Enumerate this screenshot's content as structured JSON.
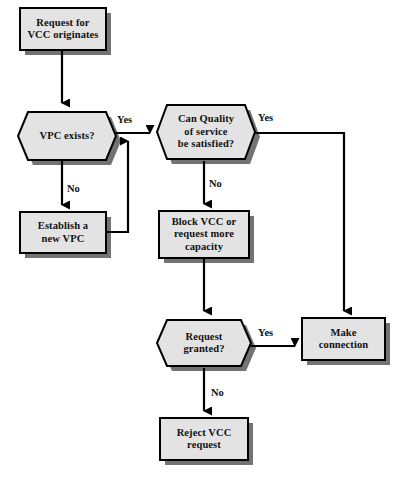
{
  "diagram": {
    "type": "flowchart",
    "colors": {
      "node_fill": "#e3e3e3",
      "node_border": "#000000",
      "node_shadow": "#737373",
      "line": "#000000",
      "text": "#111111",
      "background": "#ffffff"
    },
    "nodes": [
      {
        "id": "request-for-vcc-originates",
        "shape": "process",
        "label": "Request for\nVCC originates",
        "x": 20,
        "y": 8,
        "w": 86,
        "h": 42
      },
      {
        "id": "vpc-exists",
        "shape": "decision",
        "label": "VPC exists?",
        "x": 16,
        "y": 110,
        "w": 96,
        "h": 48
      },
      {
        "id": "establish-a-new-vpc",
        "shape": "process",
        "label": "Establish a\nnew VPC",
        "x": 20,
        "y": 212,
        "w": 86,
        "h": 41
      },
      {
        "id": "can-quality-of-service-be-satisfied",
        "shape": "decision",
        "label": "Can Quality\nof service\nbe satisfied?",
        "x": 157,
        "y": 103,
        "w": 98,
        "h": 58
      },
      {
        "id": "block-vcc-or-request-more-capacity",
        "shape": "process",
        "label": "Block VCC or\nrequest more\ncapacity",
        "x": 159,
        "y": 211,
        "w": 90,
        "h": 47
      },
      {
        "id": "request-granted",
        "shape": "decision",
        "label": "Request\ngranted?",
        "x": 155,
        "y": 318,
        "w": 96,
        "h": 50
      },
      {
        "id": "reject-vcc-request",
        "shape": "process",
        "label": "Reject VCC\nrequest",
        "x": 160,
        "y": 418,
        "w": 88,
        "h": 42
      },
      {
        "id": "make-connection",
        "shape": "process",
        "label": "Make\nconnection",
        "x": 302,
        "y": 318,
        "w": 83,
        "h": 42
      }
    ],
    "edge_labels": [
      {
        "id": "vpc-exists-yes",
        "text": "Yes",
        "x": 117,
        "y": 114
      },
      {
        "id": "vpc-exists-no",
        "text": "No",
        "x": 67,
        "y": 183
      },
      {
        "id": "qos-yes",
        "text": "Yes",
        "x": 258,
        "y": 112
      },
      {
        "id": "qos-no",
        "text": "No",
        "x": 209,
        "y": 178
      },
      {
        "id": "request-granted-yes",
        "text": "Yes",
        "x": 258,
        "y": 327
      },
      {
        "id": "request-granted-no",
        "text": "No",
        "x": 211,
        "y": 387
      }
    ],
    "edges": [
      {
        "id": "edge-start-to-vpc-exists",
        "from": "request-for-vcc-originates",
        "to": "vpc-exists",
        "label": ""
      },
      {
        "id": "edge-vpc-exists-no-to-establish",
        "from": "vpc-exists",
        "to": "establish-a-new-vpc",
        "label": "No"
      },
      {
        "id": "edge-vpc-exists-yes-to-qos",
        "from": "vpc-exists",
        "to": "can-quality-of-service-be-satisfied",
        "label": "Yes"
      },
      {
        "id": "edge-establish-to-yes-join",
        "from": "establish-a-new-vpc",
        "to": "can-quality-of-service-be-satisfied",
        "label": ""
      },
      {
        "id": "edge-qos-no-to-block",
        "from": "can-quality-of-service-be-satisfied",
        "to": "block-vcc-or-request-more-capacity",
        "label": "No"
      },
      {
        "id": "edge-qos-yes-to-make-connection",
        "from": "can-quality-of-service-be-satisfied",
        "to": "make-connection",
        "label": "Yes"
      },
      {
        "id": "edge-block-to-request-granted",
        "from": "block-vcc-or-request-more-capacity",
        "to": "request-granted",
        "label": ""
      },
      {
        "id": "edge-request-granted-yes-to-make-connection",
        "from": "request-granted",
        "to": "make-connection",
        "label": "Yes"
      },
      {
        "id": "edge-request-granted-no-to-reject",
        "from": "request-granted",
        "to": "reject-vcc-request",
        "label": "No"
      }
    ]
  }
}
